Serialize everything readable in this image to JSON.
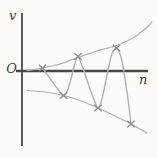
{
  "figure": {
    "background_color": "#fcfbf7",
    "axis_color": "#474744",
    "curve_color": "#b2b1ab",
    "mark_color": "#8e8d87",
    "label_color": "#3c3c39"
  },
  "labels": {
    "y_axis": "v",
    "origin": "O",
    "x_axis": "n"
  },
  "chart_data": {
    "type": "line",
    "title": "",
    "xlabel": "n",
    "ylabel": "v",
    "origin_label": "O",
    "axes_px": {
      "y_axis_x": 22,
      "y_axis_top": 13,
      "y_axis_bottom": 146,
      "x_axis_y": 71,
      "x_axis_left": 16,
      "x_axis_right": 148
    },
    "series": [
      {
        "name": "upper-envelope",
        "points": [
          [
            27,
            70.5
          ],
          [
            42.5,
            68
          ],
          [
            60,
            64
          ],
          [
            78,
            57.5
          ],
          [
            97,
            51
          ],
          [
            116.5,
            45.5
          ],
          [
            133,
            38
          ],
          [
            144,
            30
          ],
          [
            152,
            22
          ]
        ]
      },
      {
        "name": "lower-envelope",
        "points": [
          [
            27,
            90.5
          ],
          [
            45,
            92
          ],
          [
            63.5,
            95.5
          ],
          [
            80,
            100.5
          ],
          [
            98,
            108
          ],
          [
            115,
            116
          ],
          [
            131,
            124
          ],
          [
            140,
            129
          ],
          [
            147,
            133
          ]
        ]
      },
      {
        "name": "oscillation",
        "points": [
          [
            42.5,
            68
          ],
          [
            50,
            78.5
          ],
          [
            58,
            89.5
          ],
          [
            62,
            94.5
          ],
          [
            64,
            96
          ],
          [
            67,
            91.5
          ],
          [
            71,
            79
          ],
          [
            75,
            63
          ],
          [
            78,
            57
          ],
          [
            81,
            63
          ],
          [
            85,
            74
          ],
          [
            90,
            89
          ],
          [
            95,
            102
          ],
          [
            98,
            108.5
          ],
          [
            101,
            102.5
          ],
          [
            104,
            90
          ],
          [
            108,
            70
          ],
          [
            112,
            54
          ],
          [
            116.5,
            48.5
          ],
          [
            120,
            54
          ],
          [
            123,
            66
          ],
          [
            126,
            85
          ],
          [
            128.5,
            103
          ],
          [
            131,
            124
          ]
        ]
      }
    ],
    "marked_points": [
      {
        "x": 42.5,
        "y": 68,
        "role": "start-on-axis"
      },
      {
        "x": 63.5,
        "y": 95.5,
        "role": "trough"
      },
      {
        "x": 78,
        "y": 56.5,
        "role": "peak"
      },
      {
        "x": 98,
        "y": 108,
        "role": "trough"
      },
      {
        "x": 116.5,
        "y": 48,
        "role": "peak"
      },
      {
        "x": 131,
        "y": 124,
        "role": "trough"
      }
    ]
  }
}
